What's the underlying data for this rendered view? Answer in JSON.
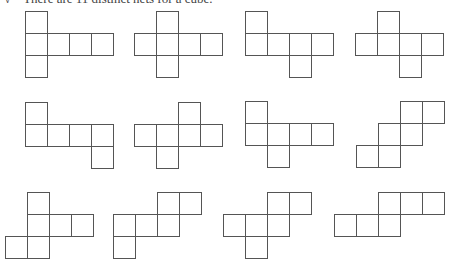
{
  "caption": {
    "bullet": "√",
    "text": "There are 11 distinct nets for a cube."
  },
  "cell_size": 23,
  "line_color": "#555555",
  "nets": [
    {
      "id": 1,
      "x": 25,
      "y": 11,
      "cells": [
        [
          0,
          0
        ],
        [
          1,
          0
        ],
        [
          1,
          1
        ],
        [
          1,
          2
        ],
        [
          1,
          3
        ],
        [
          2,
          0
        ]
      ]
    },
    {
      "id": 2,
      "x": 134,
      "y": 11,
      "cells": [
        [
          0,
          1
        ],
        [
          1,
          0
        ],
        [
          1,
          1
        ],
        [
          1,
          2
        ],
        [
          1,
          3
        ],
        [
          2,
          1
        ]
      ]
    },
    {
      "id": 3,
      "x": 245,
      "y": 11,
      "cells": [
        [
          0,
          0
        ],
        [
          1,
          0
        ],
        [
          1,
          1
        ],
        [
          1,
          2
        ],
        [
          1,
          3
        ],
        [
          2,
          2
        ]
      ]
    },
    {
      "id": 4,
      "x": 355,
      "y": 11,
      "cells": [
        [
          0,
          1
        ],
        [
          1,
          0
        ],
        [
          1,
          1
        ],
        [
          1,
          2
        ],
        [
          1,
          3
        ],
        [
          2,
          2
        ]
      ]
    },
    {
      "id": 5,
      "x": 25,
      "y": 102,
      "cells": [
        [
          0,
          0
        ],
        [
          1,
          0
        ],
        [
          1,
          1
        ],
        [
          1,
          2
        ],
        [
          1,
          3
        ],
        [
          2,
          3
        ]
      ]
    },
    {
      "id": 6,
      "x": 134,
      "y": 102,
      "cells": [
        [
          0,
          2
        ],
        [
          1,
          0
        ],
        [
          1,
          1
        ],
        [
          1,
          2
        ],
        [
          1,
          3
        ],
        [
          2,
          1
        ]
      ]
    },
    {
      "id": 7,
      "x": 245,
      "y": 101,
      "cells": [
        [
          0,
          0
        ],
        [
          1,
          0
        ],
        [
          1,
          1
        ],
        [
          1,
          2
        ],
        [
          1,
          3
        ],
        [
          2,
          1
        ]
      ]
    },
    {
      "id": 8,
      "x": 356,
      "y": 101,
      "cells": [
        [
          0,
          2
        ],
        [
          0,
          3
        ],
        [
          1,
          1
        ],
        [
          1,
          2
        ],
        [
          2,
          0
        ],
        [
          2,
          1
        ]
      ]
    },
    {
      "id": 9,
      "x": 5,
      "y": 192,
      "cells": [
        [
          0,
          1
        ],
        [
          1,
          1
        ],
        [
          1,
          2
        ],
        [
          1,
          3
        ],
        [
          2,
          0
        ],
        [
          2,
          1
        ]
      ]
    },
    {
      "id": 10,
      "x": 113,
      "y": 192,
      "cells": [
        [
          0,
          2
        ],
        [
          0,
          3
        ],
        [
          1,
          0
        ],
        [
          1,
          1
        ],
        [
          1,
          2
        ],
        [
          2,
          0
        ]
      ]
    },
    {
      "id": 11,
      "x": 223,
      "y": 192,
      "cells": [
        [
          0,
          2
        ],
        [
          0,
          3
        ],
        [
          1,
          0
        ],
        [
          1,
          1
        ],
        [
          1,
          2
        ],
        [
          2,
          1
        ]
      ]
    },
    {
      "id": 12,
      "x": 334,
      "y": 192,
      "cells": [
        [
          0,
          2
        ],
        [
          0,
          3
        ],
        [
          0,
          4
        ],
        [
          1,
          0
        ],
        [
          1,
          1
        ],
        [
          1,
          2
        ]
      ]
    }
  ]
}
